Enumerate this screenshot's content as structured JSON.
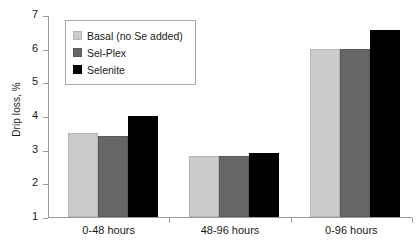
{
  "chart_data": {
    "type": "bar",
    "title": "",
    "xlabel": "",
    "ylabel": "Drip loss, %",
    "categories": [
      "0-48 hours",
      "48-96 hours",
      "0-96 hours"
    ],
    "series": [
      {
        "name": "Basal (no Se added)",
        "color": "#cccccc",
        "values": [
          3.5,
          2.8,
          6.0
        ]
      },
      {
        "name": "Sel-Plex",
        "color": "#666666",
        "values": [
          3.4,
          2.8,
          6.0
        ]
      },
      {
        "name": "Selenite",
        "color": "#000000",
        "values": [
          4.0,
          2.9,
          6.55
        ]
      }
    ],
    "ylim": [
      1,
      7
    ],
    "yticks": [
      1,
      2,
      3,
      4,
      5,
      6,
      7
    ],
    "ytick_labels": [
      "1",
      "2",
      "3",
      "4",
      "5",
      "6",
      "7"
    ],
    "grid": false,
    "legend_position": "upper-left-inside"
  }
}
